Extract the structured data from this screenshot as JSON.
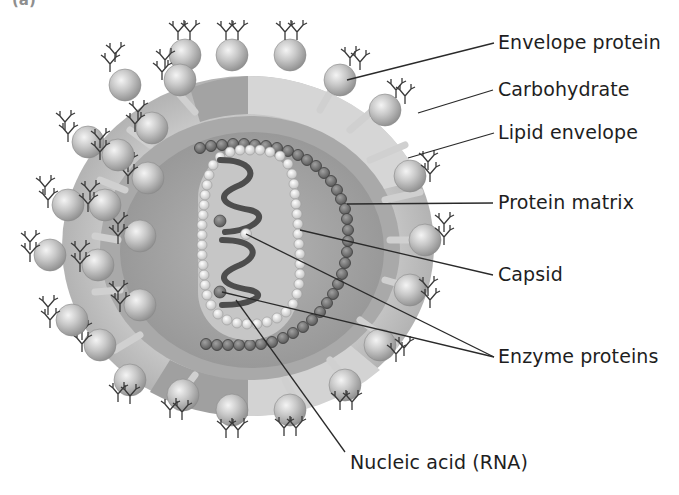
{
  "title": {
    "visible_text": "(a)",
    "note": "cropped"
  },
  "diagram": {
    "labels": [
      {
        "id": "envelope_protein",
        "text": "Envelope protein",
        "x": 498,
        "y": 30
      },
      {
        "id": "carbohydrate",
        "text": "Carbohydrate",
        "x": 498,
        "y": 77
      },
      {
        "id": "lipid_envelope",
        "text": "Lipid envelope",
        "x": 498,
        "y": 120
      },
      {
        "id": "protein_matrix",
        "text": "Protein matrix",
        "x": 498,
        "y": 190
      },
      {
        "id": "capsid",
        "text": "Capsid",
        "x": 498,
        "y": 262
      },
      {
        "id": "enzyme_proteins",
        "text": "Enzyme proteins",
        "x": 498,
        "y": 344
      },
      {
        "id": "nucleic_acid",
        "text": "Nucleic acid (RNA)",
        "x": 350,
        "y": 450
      }
    ],
    "colors": {
      "background": "#ffffff",
      "outer_envelope": "#bdbdbd",
      "outer_envelope_light": "#d9d9d9",
      "matrix_layer": "#9a9a9a",
      "core": "#a8a8a8",
      "capsid_inner": "#c9c9c9",
      "bead_dark": "#6e6e6e",
      "bead_light": "#e6e6e6",
      "rna": "#555555",
      "label_text": "#1e1e1e",
      "leader_line": "#2a2a2a",
      "sphere": "#c4c4c4"
    }
  }
}
